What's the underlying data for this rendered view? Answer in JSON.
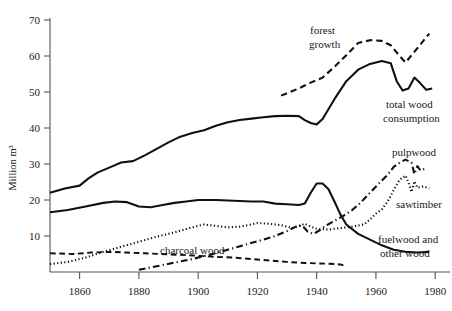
{
  "chart_data": {
    "type": "line",
    "title": "",
    "subtitle": "",
    "xlabel": "",
    "ylabel": "Million m³",
    "xlim": [
      1850,
      1985
    ],
    "ylim": [
      0,
      72
    ],
    "grid": false,
    "legend_position": "inline-annotations",
    "x_ticks": [
      1860,
      1880,
      1900,
      1920,
      1940,
      1960,
      1980
    ],
    "x_tick_labels": [
      "1860",
      "1880",
      "1900",
      "1920",
      "1940",
      "1960",
      "1980"
    ],
    "y_ticks": [
      10,
      20,
      30,
      40,
      50,
      60,
      70
    ],
    "y_tick_labels": [
      "10",
      "20",
      "30",
      "40",
      "50",
      "60",
      "70"
    ],
    "series": [
      {
        "name": "total wood consumption",
        "style": "solid",
        "width": 2.1,
        "label": "total wood consumption",
        "label_x": 1969,
        "label_y": 44,
        "points": [
          [
            1850,
            22.0
          ],
          [
            1855,
            23.2
          ],
          [
            1860,
            24.0
          ],
          [
            1863,
            26.0
          ],
          [
            1866,
            27.6
          ],
          [
            1870,
            29.0
          ],
          [
            1874,
            30.4
          ],
          [
            1878,
            30.8
          ],
          [
            1882,
            32.4
          ],
          [
            1886,
            34.2
          ],
          [
            1890,
            36.0
          ],
          [
            1894,
            37.6
          ],
          [
            1898,
            38.6
          ],
          [
            1902,
            39.4
          ],
          [
            1906,
            40.6
          ],
          [
            1910,
            41.6
          ],
          [
            1914,
            42.2
          ],
          [
            1918,
            42.6
          ],
          [
            1922,
            43.0
          ],
          [
            1926,
            43.3
          ],
          [
            1930,
            43.4
          ],
          [
            1934,
            43.3
          ],
          [
            1936,
            42.2
          ],
          [
            1938,
            41.4
          ],
          [
            1940,
            41.0
          ],
          [
            1942,
            42.5
          ],
          [
            1946,
            48.0
          ],
          [
            1950,
            53.0
          ],
          [
            1954,
            56.2
          ],
          [
            1958,
            57.8
          ],
          [
            1962,
            58.6
          ],
          [
            1965,
            58.0
          ],
          [
            1967,
            53.0
          ],
          [
            1969,
            50.4
          ],
          [
            1971,
            51.0
          ],
          [
            1973,
            54.0
          ],
          [
            1975,
            52.4
          ],
          [
            1977,
            50.6
          ],
          [
            1979,
            51.0
          ]
        ]
      },
      {
        "name": "forest growth",
        "style": "dashed",
        "width": 2.1,
        "label": "forest growth",
        "label_x": 1938,
        "label_y": 64,
        "points": [
          [
            1928,
            49.0
          ],
          [
            1934,
            51.0
          ],
          [
            1938,
            52.6
          ],
          [
            1942,
            54.0
          ],
          [
            1946,
            57.0
          ],
          [
            1950,
            60.2
          ],
          [
            1954,
            63.6
          ],
          [
            1958,
            64.4
          ],
          [
            1962,
            64.2
          ],
          [
            1965,
            63.0
          ],
          [
            1968,
            60.0
          ],
          [
            1970,
            58.2
          ],
          [
            1974,
            62.2
          ],
          [
            1978,
            66.2
          ]
        ]
      },
      {
        "name": "fuelwood and other wood",
        "style": "solid",
        "width": 2.1,
        "label": "fuelwood and other wood",
        "label_x": 1962,
        "label_y": 15,
        "points": [
          [
            1850,
            16.6
          ],
          [
            1856,
            17.2
          ],
          [
            1862,
            18.2
          ],
          [
            1868,
            19.2
          ],
          [
            1872,
            19.6
          ],
          [
            1876,
            19.4
          ],
          [
            1880,
            18.2
          ],
          [
            1884,
            18.0
          ],
          [
            1888,
            18.6
          ],
          [
            1892,
            19.2
          ],
          [
            1896,
            19.6
          ],
          [
            1900,
            20.0
          ],
          [
            1906,
            20.0
          ],
          [
            1912,
            19.8
          ],
          [
            1918,
            19.6
          ],
          [
            1922,
            19.6
          ],
          [
            1926,
            19.0
          ],
          [
            1930,
            18.8
          ],
          [
            1934,
            18.6
          ],
          [
            1936,
            19.0
          ],
          [
            1938,
            22.0
          ],
          [
            1940,
            24.6
          ],
          [
            1942,
            24.6
          ],
          [
            1944,
            23.0
          ],
          [
            1946,
            19.6
          ],
          [
            1948,
            16.0
          ],
          [
            1950,
            13.2
          ],
          [
            1954,
            10.6
          ],
          [
            1958,
            9.0
          ],
          [
            1962,
            7.4
          ],
          [
            1966,
            6.2
          ],
          [
            1970,
            5.6
          ],
          [
            1974,
            5.4
          ],
          [
            1978,
            5.6
          ]
        ]
      },
      {
        "name": "charcoal wood",
        "style": "dashed",
        "width": 1.9,
        "label": "charcoal wood",
        "label_x": 1894,
        "label_y": 8.2,
        "points": [
          [
            1850,
            5.2
          ],
          [
            1858,
            5.0
          ],
          [
            1864,
            5.4
          ],
          [
            1870,
            5.6
          ],
          [
            1876,
            5.4
          ],
          [
            1882,
            5.2
          ],
          [
            1890,
            4.9
          ],
          [
            1898,
            4.6
          ],
          [
            1906,
            4.2
          ],
          [
            1912,
            4.0
          ],
          [
            1918,
            3.6
          ],
          [
            1924,
            3.2
          ],
          [
            1930,
            2.8
          ],
          [
            1936,
            2.5
          ],
          [
            1940,
            2.4
          ],
          [
            1944,
            2.3
          ],
          [
            1948,
            2.1
          ],
          [
            1950,
            1.6
          ]
        ]
      },
      {
        "name": "sawtimber",
        "style": "dotted",
        "width": 2.1,
        "label": "sawtimber",
        "label_x": 1967,
        "label_y": 24.2,
        "points": [
          [
            1850,
            2.2
          ],
          [
            1856,
            2.8
          ],
          [
            1862,
            4.0
          ],
          [
            1868,
            5.6
          ],
          [
            1874,
            7.0
          ],
          [
            1880,
            8.4
          ],
          [
            1886,
            9.8
          ],
          [
            1892,
            11.0
          ],
          [
            1898,
            12.4
          ],
          [
            1902,
            13.2
          ],
          [
            1906,
            12.8
          ],
          [
            1910,
            12.4
          ],
          [
            1914,
            12.6
          ],
          [
            1918,
            13.2
          ],
          [
            1920,
            13.6
          ],
          [
            1924,
            13.4
          ],
          [
            1928,
            13.0
          ],
          [
            1932,
            12.2
          ],
          [
            1934,
            12.8
          ],
          [
            1936,
            13.4
          ],
          [
            1938,
            12.6
          ],
          [
            1940,
            12.0
          ],
          [
            1944,
            11.8
          ],
          [
            1948,
            12.2
          ],
          [
            1952,
            12.6
          ],
          [
            1956,
            13.2
          ],
          [
            1958,
            14.6
          ],
          [
            1960,
            16.2
          ],
          [
            1962,
            17.4
          ],
          [
            1964,
            19.6
          ],
          [
            1966,
            22.8
          ],
          [
            1968,
            25.6
          ],
          [
            1970,
            26.8
          ],
          [
            1971,
            24.8
          ],
          [
            1972,
            22.2
          ],
          [
            1973,
            25.2
          ],
          [
            1974,
            23.4
          ],
          [
            1976,
            23.8
          ],
          [
            1978,
            23.2
          ]
        ]
      },
      {
        "name": "pulpwood",
        "style": "dashdot",
        "width": 2.1,
        "label": "pulpwood",
        "label_x": 1967,
        "label_y": 33.6,
        "points": [
          [
            1880,
            0.6
          ],
          [
            1886,
            1.6
          ],
          [
            1892,
            2.6
          ],
          [
            1898,
            3.6
          ],
          [
            1904,
            4.8
          ],
          [
            1910,
            6.2
          ],
          [
            1916,
            7.6
          ],
          [
            1922,
            9.0
          ],
          [
            1926,
            10.0
          ],
          [
            1930,
            11.4
          ],
          [
            1933,
            12.6
          ],
          [
            1935,
            13.0
          ],
          [
            1937,
            11.2
          ],
          [
            1939,
            10.6
          ],
          [
            1941,
            11.6
          ],
          [
            1943,
            12.8
          ],
          [
            1946,
            14.2
          ],
          [
            1949,
            15.6
          ],
          [
            1952,
            17.2
          ],
          [
            1955,
            19.4
          ],
          [
            1958,
            22.0
          ],
          [
            1961,
            24.6
          ],
          [
            1964,
            27.0
          ],
          [
            1966,
            29.2
          ],
          [
            1968,
            30.4
          ],
          [
            1970,
            31.2
          ],
          [
            1972,
            30.4
          ],
          [
            1973,
            27.2
          ],
          [
            1974,
            29.4
          ],
          [
            1975,
            28.2
          ],
          [
            1977,
            28.8
          ]
        ]
      }
    ],
    "annotations": [
      {
        "text": "forest growth",
        "x": 1938,
        "y": 64
      },
      {
        "text": "total wood consumption",
        "x": 1969,
        "y": 44
      },
      {
        "text": "pulpwood",
        "x": 1967,
        "y": 33.6
      },
      {
        "text": "sawtimber",
        "x": 1967,
        "y": 24.2
      },
      {
        "text": "charcoal wood",
        "x": 1894,
        "y": 8.2
      },
      {
        "text": "fuelwood and other wood",
        "x": 1962,
        "y": 15
      }
    ]
  },
  "labels": {
    "y_axis_title": "Million m³",
    "forest_growth_line1": "forest",
    "forest_growth_line2": "growth",
    "total_wood_line1": "total wood",
    "total_wood_line2": "consumption",
    "pulpwood": "pulpwood",
    "sawtimber": "sawtimber",
    "charcoal_wood": "charcoal wood",
    "fuelwood_line1": "fuelwood and",
    "fuelwood_line2": "other wood",
    "tick_1860": "1860",
    "tick_1880": "1880",
    "tick_1900": "1900",
    "tick_1920": "1920",
    "tick_1940": "1940",
    "tick_1960": "1960",
    "tick_1980": "1980",
    "tick_10": "10",
    "tick_20": "20",
    "tick_30": "30",
    "tick_40": "40",
    "tick_50": "50",
    "tick_60": "60",
    "tick_70": "70"
  }
}
